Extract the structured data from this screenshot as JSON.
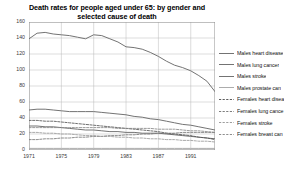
{
  "chart_data": {
    "type": "line",
    "title": "Death rates for people aged under 65: by gender and selected cause of death",
    "title_lines": [
      "Death rates for people aged under 65: by gender and",
      "selected cause of death"
    ],
    "xlabel": "",
    "ylabel": "",
    "xlim": [
      1971,
      1994
    ],
    "ylim": [
      0,
      160
    ],
    "grid": true,
    "legend_position": "right",
    "y_ticks": [
      0,
      20,
      40,
      60,
      80,
      100,
      120,
      140,
      160
    ],
    "y_tick_labels": [
      "0",
      "20",
      "40",
      "60",
      "80",
      "100",
      "120",
      "140",
      "160"
    ],
    "x_ticks": [
      1971,
      1975,
      1979,
      1983,
      1987,
      1991
    ],
    "x_tick_labels": [
      "1971",
      "1975",
      "1979",
      "1983",
      "1987",
      "1991"
    ],
    "x": [
      1971,
      1972,
      1973,
      1974,
      1975,
      1976,
      1977,
      1978,
      1979,
      1980,
      1981,
      1982,
      1983,
      1984,
      1985,
      1986,
      1987,
      1988,
      1989,
      1990,
      1991,
      1992,
      1993,
      1994
    ],
    "series": [
      {
        "name": "Males heart disease",
        "style": "solid",
        "color": "#6b6b6b",
        "values": [
          139,
          146,
          147,
          145,
          144,
          143,
          141,
          139,
          144,
          143,
          139,
          135,
          129,
          128,
          126,
          122,
          117,
          111,
          106,
          103,
          99,
          93,
          86,
          73
        ]
      },
      {
        "name": "Males lung cancer",
        "style": "solid",
        "color": "#6b6b6b",
        "values": [
          50,
          51,
          51,
          50,
          49,
          48,
          48,
          48,
          48,
          47,
          46,
          45,
          44,
          42,
          41,
          39,
          38,
          36,
          34,
          32,
          31,
          29,
          27,
          25
        ]
      },
      {
        "name": "Males stroke",
        "style": "solid",
        "color": "#6b6b6b",
        "values": [
          30,
          30,
          29,
          29,
          28,
          27,
          26,
          25,
          25,
          24,
          23,
          23,
          22,
          22,
          21,
          21,
          21,
          20,
          19,
          18,
          17,
          16,
          15,
          14
        ]
      },
      {
        "name": "Males prostate cancer",
        "style": "solid",
        "color": "#a8a8a8",
        "values": [
          2,
          2,
          2,
          2,
          2,
          2,
          2,
          2,
          2,
          2,
          2,
          2,
          2,
          2,
          2,
          2,
          2,
          2,
          2,
          2,
          2,
          2,
          2,
          2
        ]
      },
      {
        "name": "Females heart disease",
        "style": "dashed",
        "color": "#555555",
        "values": [
          37,
          37,
          36,
          36,
          35,
          34,
          33,
          32,
          31,
          30,
          29,
          28,
          27,
          26,
          25,
          24,
          23,
          21,
          20,
          19,
          18,
          16,
          15,
          13
        ]
      },
      {
        "name": "Females lung cancer",
        "style": "dashed",
        "color": "#777777",
        "values": [
          13,
          13,
          14,
          14,
          15,
          15,
          16,
          16,
          17,
          17,
          18,
          18,
          19,
          19,
          20,
          20,
          21,
          21,
          21,
          22,
          22,
          22,
          22,
          22
        ]
      },
      {
        "name": "Females stroke",
        "style": "dashed",
        "color": "#999999",
        "values": [
          22,
          22,
          21,
          21,
          20,
          20,
          19,
          18,
          18,
          17,
          17,
          16,
          16,
          15,
          15,
          14,
          14,
          13,
          13,
          12,
          12,
          11,
          11,
          10
        ]
      },
      {
        "name": "Females breast cancer",
        "style": "dashed",
        "color": "#888888",
        "values": [
          28,
          28,
          28,
          28,
          28,
          28,
          28,
          28,
          28,
          28,
          28,
          27,
          27,
          27,
          27,
          27,
          26,
          26,
          26,
          25,
          24,
          24,
          23,
          22
        ]
      }
    ],
    "legend_entries": [
      {
        "label": "Males heart disease",
        "style": "solid",
        "color": "#6b6b6b"
      },
      {
        "label": "Males lung cancer",
        "style": "solid",
        "color": "#6b6b6b"
      },
      {
        "label": "Males stroke",
        "style": "solid",
        "color": "#6b6b6b"
      },
      {
        "label": "Males prostate can",
        "style": "solid",
        "color": "#a8a8a8"
      },
      {
        "label": "Females heart disea",
        "style": "dashed",
        "color": "#555555"
      },
      {
        "label": "Females lung cance",
        "style": "dashed",
        "color": "#777777"
      },
      {
        "label": "Females stroke",
        "style": "dashed",
        "color": "#999999"
      },
      {
        "label": "Females breast can",
        "style": "dashed",
        "color": "#888888"
      }
    ]
  }
}
